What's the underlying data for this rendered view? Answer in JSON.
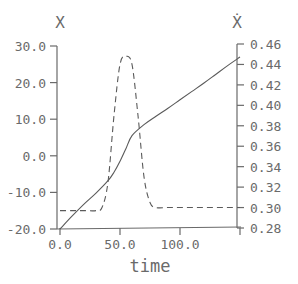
{
  "chart_data": {
    "type": "line",
    "title": "",
    "xlabel": "time",
    "ylabel_left": "X",
    "ylabel_right": "Ẋ",
    "xlim": [
      0,
      150
    ],
    "ylim_left": [
      -20,
      30
    ],
    "ylim_right": [
      0.28,
      0.46
    ],
    "x_ticks": [
      0,
      50,
      100,
      150
    ],
    "x_tick_labels": [
      "0.0",
      "50.0",
      "100.0"
    ],
    "y_left_ticks": [
      30,
      20,
      10,
      0,
      -10,
      -20
    ],
    "y_left_tick_labels": [
      "30.0",
      "20.0",
      "10.0",
      "0.0",
      "-10.0",
      "-20.0"
    ],
    "y_right_ticks": [
      0.46,
      0.44,
      0.42,
      0.4,
      0.38,
      0.36,
      0.34,
      0.32,
      0.3,
      0.28
    ],
    "y_right_tick_labels": [
      "0.46",
      "0.44",
      "0.42",
      "0.40",
      "0.38",
      "0.36",
      "0.34",
      "0.32",
      "0.30",
      "0.28"
    ],
    "grid": false,
    "legend": "none",
    "series": [
      {
        "name": "X",
        "axis": "left",
        "style": "solid",
        "x": [
          0,
          10,
          20,
          30,
          40,
          45,
          50,
          55,
          60,
          70,
          80,
          90,
          100,
          110,
          120,
          130,
          140,
          150
        ],
        "values": [
          -20,
          -16.5,
          -13.2,
          -10.2,
          -6.8,
          -4.5,
          -1.5,
          2,
          5.5,
          8.5,
          10.8,
          13,
          15.3,
          17.6,
          19.9,
          22.3,
          24.7,
          27
        ]
      },
      {
        "name": "X_dot",
        "axis": "right",
        "style": "dashed",
        "x": [
          0,
          10,
          20,
          30,
          35,
          40,
          45,
          50,
          55,
          60,
          65,
          70,
          75,
          80,
          90,
          100,
          110,
          120,
          130,
          140,
          150
        ],
        "values": [
          0.297,
          0.297,
          0.297,
          0.297,
          0.3,
          0.325,
          0.39,
          0.44,
          0.448,
          0.44,
          0.39,
          0.33,
          0.305,
          0.3,
          0.3,
          0.3,
          0.3,
          0.3,
          0.3,
          0.3,
          0.3
        ]
      }
    ]
  },
  "colors": {
    "axis": "#6a6a6a",
    "line": "#5a5a5a"
  }
}
